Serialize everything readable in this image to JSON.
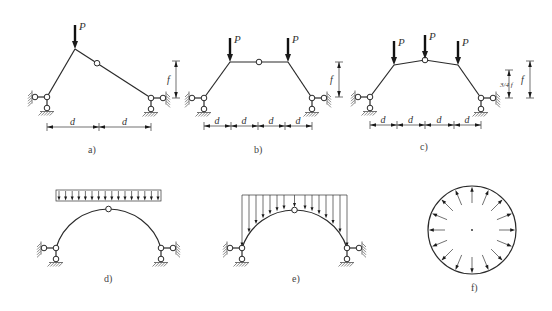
{
  "figure": {
    "type": "structural-mechanics-diagram",
    "subfigures": [
      {
        "id": "a",
        "caption": "a)",
        "description": "Three-hinged frame, inclined members, one point load at the apex",
        "load_label": "P",
        "span_labels": [
          "d",
          "d"
        ],
        "rise_label": "f"
      },
      {
        "id": "b",
        "caption": "b)",
        "description": "Three-hinged trapezoidal frame with two point loads",
        "load_labels": [
          "P",
          "P"
        ],
        "span_labels": [
          "d",
          "d",
          "d",
          "d"
        ],
        "rise_label": "f"
      },
      {
        "id": "c",
        "caption": "c)",
        "description": "Three-hinged polygonal arch with three point loads",
        "load_labels": [
          "P",
          "P",
          "P"
        ],
        "span_labels": [
          "d",
          "d",
          "d",
          "d"
        ],
        "rise_labels": [
          "3/4 f",
          "f"
        ]
      },
      {
        "id": "d",
        "caption": "d)",
        "description": "Three-hinged circular arch under uniform vertical load over horizontal projection",
        "load_arrow_count": 16
      },
      {
        "id": "e",
        "caption": "e)",
        "description": "Three-hinged circular arch with vertical load acting on the arch curve",
        "load_arrow_count": 16
      },
      {
        "id": "f",
        "caption": "f)",
        "description": "Circular ring under uniform radial pressure",
        "radial_arrow_count": 16
      }
    ]
  }
}
